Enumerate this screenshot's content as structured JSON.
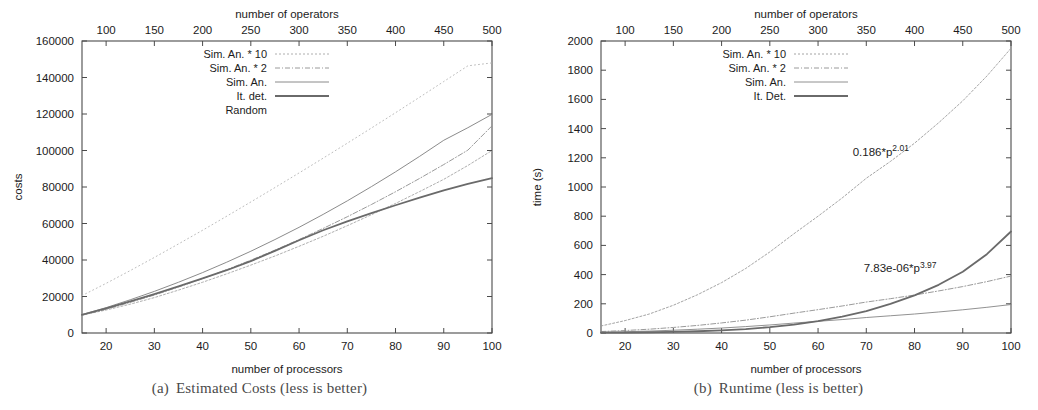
{
  "figure": {
    "panels": [
      {
        "id": "estimated-costs",
        "caption_tag": "(a)",
        "caption_text": "Estimated Costs (less is better)",
        "chart_index": 0
      },
      {
        "id": "runtime",
        "caption_tag": "(b)",
        "caption_text": "Runtime (less is better)",
        "chart_index": 1
      }
    ]
  },
  "chart_data": [
    {
      "type": "line",
      "title": "",
      "xlabel": "number of processors",
      "ylabel": "costs",
      "x2label": "number of operators",
      "xlim": [
        15,
        100
      ],
      "ylim": [
        0,
        160000
      ],
      "x2lim": [
        75,
        500
      ],
      "xticks": [
        20,
        30,
        40,
        50,
        60,
        70,
        80,
        90,
        100
      ],
      "xticklabels": [
        "20",
        "30",
        "40",
        "50",
        "60",
        "70",
        "80",
        "90",
        "100"
      ],
      "yticks": [
        0,
        20000,
        40000,
        60000,
        80000,
        100000,
        120000,
        140000,
        160000
      ],
      "yticklabels": [
        "0",
        "20000",
        "40000",
        "60000",
        "80000",
        "100000",
        "120000",
        "140000",
        "160000"
      ],
      "x2ticks": [
        100,
        150,
        200,
        250,
        300,
        350,
        400,
        450,
        500
      ],
      "x2ticklabels": [
        "100",
        "150",
        "200",
        "250",
        "300",
        "350",
        "400",
        "450",
        "500"
      ],
      "grid": false,
      "legend_position": "top-left",
      "series": [
        {
          "name": "Sim. An. * 10",
          "color": "#9a9a9a",
          "width": 0.8,
          "dash": "2,2",
          "x": [
            15,
            20,
            25,
            30,
            35,
            40,
            45,
            50,
            55,
            60,
            65,
            70,
            75,
            80,
            85,
            90,
            95,
            100
          ],
          "values": [
            9800,
            12600,
            15800,
            19400,
            23500,
            27800,
            32400,
            37200,
            42200,
            47500,
            53000,
            58800,
            64800,
            71000,
            77500,
            84200,
            91800,
            100000
          ]
        },
        {
          "name": "Sim. An. * 2",
          "color": "#8e8e8e",
          "width": 0.9,
          "dash": "5,2,1,2",
          "x": [
            15,
            20,
            25,
            30,
            35,
            40,
            45,
            50,
            55,
            60,
            65,
            70,
            75,
            80,
            85,
            90,
            95,
            100
          ],
          "values": [
            9700,
            13000,
            16800,
            20800,
            25200,
            29800,
            34700,
            39900,
            45400,
            51200,
            57300,
            63700,
            70400,
            77400,
            84700,
            92300,
            100200,
            113500
          ]
        },
        {
          "name": "Sim. An.",
          "color": "#7e7e7e",
          "width": 0.9,
          "dash": "none",
          "x": [
            15,
            20,
            25,
            30,
            35,
            40,
            45,
            50,
            55,
            60,
            65,
            70,
            75,
            80,
            85,
            90,
            95,
            100
          ],
          "values": [
            10100,
            13900,
            18200,
            22800,
            27800,
            33100,
            38800,
            44800,
            51200,
            57900,
            65000,
            72400,
            80200,
            88300,
            96800,
            105600,
            112500,
            119800
          ]
        },
        {
          "name": "It. det.",
          "color": "#6a6a6a",
          "width": 1.8,
          "dash": "none",
          "x": [
            15,
            20,
            25,
            30,
            35,
            40,
            45,
            50,
            55,
            60,
            65,
            70,
            75,
            80,
            85,
            90,
            95,
            100
          ],
          "values": [
            10000,
            13500,
            17300,
            21300,
            25500,
            29900,
            34400,
            39400,
            45000,
            50800,
            56300,
            61200,
            65700,
            70000,
            74200,
            78200,
            81700,
            84800
          ]
        },
        {
          "name": "Random",
          "color": "#b4b4b4",
          "width": 0.9,
          "dash": "1,3",
          "x": [
            15,
            20,
            25,
            30,
            35,
            40,
            45,
            50,
            55,
            60,
            65,
            70,
            75,
            80,
            85,
            90,
            95,
            100
          ],
          "values": [
            20500,
            27200,
            34200,
            41400,
            48800,
            56300,
            64000,
            71800,
            79700,
            87700,
            95800,
            104000,
            112300,
            120700,
            129200,
            137800,
            146400,
            148000
          ]
        }
      ]
    },
    {
      "type": "line",
      "title": "",
      "xlabel": "number of processors",
      "ylabel": "time (s)",
      "x2label": "number of operators",
      "xlim": [
        15,
        100
      ],
      "ylim": [
        0,
        2000
      ],
      "x2lim": [
        75,
        500
      ],
      "xticks": [
        20,
        30,
        40,
        50,
        60,
        70,
        80,
        90,
        100
      ],
      "xticklabels": [
        "20",
        "30",
        "40",
        "50",
        "60",
        "70",
        "80",
        "90",
        "100"
      ],
      "yticks": [
        0,
        200,
        400,
        600,
        800,
        1000,
        1200,
        1400,
        1600,
        1800,
        2000
      ],
      "yticklabels": [
        "0",
        "200",
        "400",
        "600",
        "800",
        "1000",
        "1200",
        "1400",
        "1600",
        "1800",
        "2000"
      ],
      "x2ticks": [
        100,
        150,
        200,
        250,
        300,
        350,
        400,
        450,
        500
      ],
      "x2ticklabels": [
        "100",
        "150",
        "200",
        "250",
        "300",
        "350",
        "400",
        "450",
        "500"
      ],
      "grid": false,
      "legend_position": "top-left",
      "annotations": [
        {
          "text": "0.186*p",
          "sup": "2.01",
          "x": 73,
          "y": 1215
        },
        {
          "text": "7.83e-06*p",
          "sup": "3.97",
          "x": 77,
          "y": 415
        }
      ],
      "series": [
        {
          "name": "Sim. An. * 10",
          "color": "#9a9a9a",
          "width": 0.9,
          "dash": "2,2",
          "x": [
            15,
            20,
            25,
            30,
            35,
            40,
            45,
            50,
            55,
            60,
            65,
            70,
            75,
            80,
            85,
            90,
            95,
            100
          ],
          "values": [
            48,
            85,
            130,
            190,
            262,
            345,
            442,
            555,
            680,
            800,
            925,
            1060,
            1175,
            1300,
            1440,
            1590,
            1760,
            1950
          ]
        },
        {
          "name": "Sim. An. * 2",
          "color": "#8e8e8e",
          "width": 0.9,
          "dash": "5,2,1,2",
          "x": [
            15,
            20,
            25,
            30,
            35,
            40,
            45,
            50,
            55,
            60,
            65,
            70,
            75,
            80,
            85,
            90,
            95,
            100
          ],
          "values": [
            10,
            17,
            26,
            38,
            52,
            69,
            88,
            111,
            136,
            160,
            185,
            212,
            235,
            260,
            288,
            318,
            352,
            390
          ]
        },
        {
          "name": "Sim. An.",
          "color": "#858585",
          "width": 0.9,
          "dash": "none",
          "x": [
            15,
            20,
            25,
            30,
            35,
            40,
            45,
            50,
            55,
            60,
            65,
            70,
            75,
            80,
            85,
            90,
            95,
            100
          ],
          "values": [
            5,
            9,
            13,
            19,
            26,
            34,
            44,
            55,
            68,
            80,
            92,
            106,
            118,
            130,
            144,
            159,
            176,
            195
          ]
        },
        {
          "name": "It. Det.",
          "color": "#6a6a6a",
          "width": 1.8,
          "dash": "none",
          "x": [
            15,
            20,
            25,
            30,
            35,
            40,
            45,
            50,
            55,
            60,
            65,
            70,
            75,
            80,
            85,
            90,
            95,
            100
          ],
          "values": [
            2,
            3,
            5,
            8,
            12,
            18,
            27,
            40,
            58,
            82,
            112,
            150,
            200,
            258,
            330,
            420,
            540,
            695
          ]
        }
      ]
    }
  ]
}
